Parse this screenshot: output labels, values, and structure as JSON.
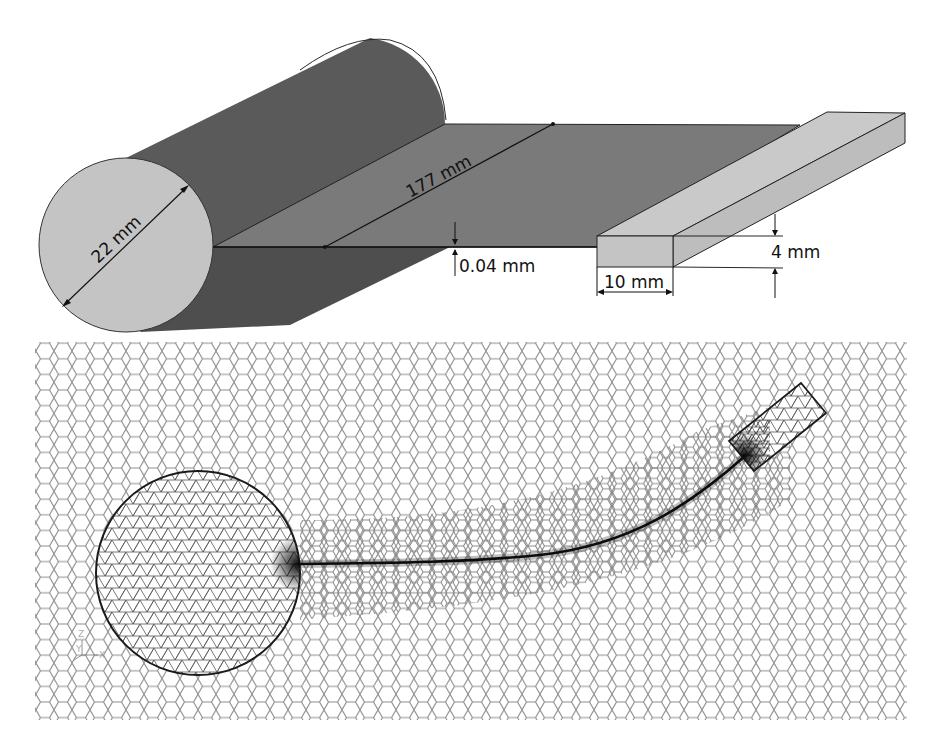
{
  "figure": {
    "top_panel": {
      "description": "3D geometry: cylinder, thin sheet, rectangular bar",
      "colors": {
        "cylinder_body": "#5a5a5a",
        "cylinder_face": "#c4c4c4",
        "sheet": "#7a7a7a",
        "bar": "#c8c8c8",
        "edge": "#222222"
      },
      "dimensions": {
        "cylinder_diameter": "22 mm",
        "sheet_length": "177 mm",
        "sheet_thickness": "0.04 mm",
        "bar_width": "10 mm",
        "bar_height": "4 mm"
      }
    },
    "bottom_panel": {
      "description": "2D computational mesh: polyhedral outer domain, triangular mesh inside circle and bar, refined along curved sheet",
      "colors": {
        "mesh_line": "#8c8c8c",
        "inner_mesh_line": "#555555",
        "boundary": "#1a1a1a"
      },
      "axis_triad": {
        "z": "Z",
        "y": "Y",
        "x": "X"
      }
    }
  }
}
